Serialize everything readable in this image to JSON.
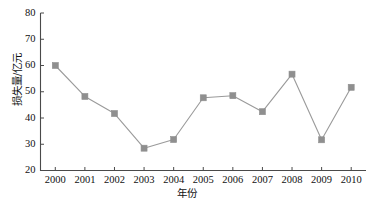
{
  "chart_data": {
    "type": "line",
    "title": "",
    "xlabel": "年份",
    "ylabel": "损失量/亿元",
    "categories": [
      "2000",
      "2001",
      "2002",
      "2003",
      "2004",
      "2005",
      "2006",
      "2007",
      "2008",
      "2009",
      "2010"
    ],
    "values": [
      60.0,
      48.2,
      41.7,
      28.5,
      31.8,
      47.7,
      48.5,
      42.4,
      56.7,
      31.7,
      51.7
    ],
    "series": [
      {
        "name": "损失量",
        "values": [
          60.0,
          48.2,
          41.7,
          28.5,
          31.8,
          47.7,
          48.5,
          42.4,
          56.7,
          31.7,
          51.7
        ]
      }
    ],
    "ylim": [
      20,
      80
    ],
    "yticks": [
      20,
      30,
      40,
      50,
      60,
      70,
      80
    ],
    "ytick_labels": [
      "20",
      "30",
      "40",
      "50",
      "60",
      "70",
      "80"
    ],
    "xticks": [
      "2000",
      "2001",
      "2002",
      "2003",
      "2004",
      "2005",
      "2006",
      "2007",
      "2008",
      "2009",
      "2010"
    ],
    "grid": false,
    "legend": false,
    "legend_position": "none",
    "marker": "square",
    "line_color": "#9a9a9a",
    "marker_color": "#8f8f8f",
    "axis_color": "#4a4a4a",
    "background_color": "#ffffff"
  }
}
